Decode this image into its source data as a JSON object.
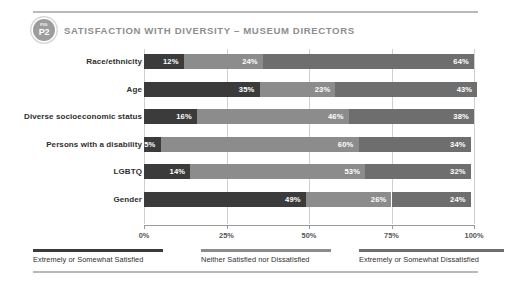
{
  "header": {
    "badge_kicker": "FIG",
    "badge_number": "P2",
    "title": "SATISFACTION WITH DIVERSITY – MUSEUM DIRECTORS"
  },
  "chart_data": {
    "type": "bar",
    "orientation": "horizontal",
    "stacked": true,
    "normalized_percent": true,
    "title": "SATISFACTION WITH DIVERSITY – MUSEUM DIRECTORS",
    "xlabel": "",
    "ylabel": "",
    "xlim": [
      0,
      100
    ],
    "xticks": [
      0,
      25,
      50,
      75,
      100
    ],
    "xticklabels": [
      "0%",
      "25%",
      "50%",
      "75%",
      "100%"
    ],
    "grid": true,
    "legend_position": "bottom",
    "categories": [
      "Race/ethnicity",
      "Age",
      "Diverse socioeconomic status",
      "Persons with a disability",
      "LGBTQ",
      "Gender"
    ],
    "series": [
      {
        "name": "Extremely or Somewhat Satisfied",
        "color": "#3b3b3b",
        "values": [
          12,
          35,
          16,
          5,
          14,
          49
        ],
        "labels": [
          "12%",
          "35%",
          "16%",
          "5%",
          "14%",
          "49%"
        ]
      },
      {
        "name": "Neither Satisfied nor Dissatisfied",
        "color": "#8c8c8c",
        "values": [
          24,
          23,
          46,
          60,
          53,
          26
        ],
        "labels": [
          "24%",
          "23%",
          "46%",
          "60%",
          "53%",
          "26%"
        ]
      },
      {
        "name": "Extremely or Somewhat Dissatisfied",
        "color": "#6e6e6e",
        "values": [
          64,
          43,
          38,
          34,
          32,
          24
        ],
        "labels": [
          "64%",
          "43%",
          "38%",
          "34%",
          "32%",
          "24%"
        ]
      }
    ]
  },
  "legend": [
    {
      "label": "Extremely or Somewhat Satisfied",
      "color": "#3b3b3b"
    },
    {
      "label": "Neither Satisfied nor Dissatisfied",
      "color": "#8c8c8c"
    },
    {
      "label": "Extremely or Somewhat Dissatisfied",
      "color": "#6e6e6e"
    }
  ]
}
